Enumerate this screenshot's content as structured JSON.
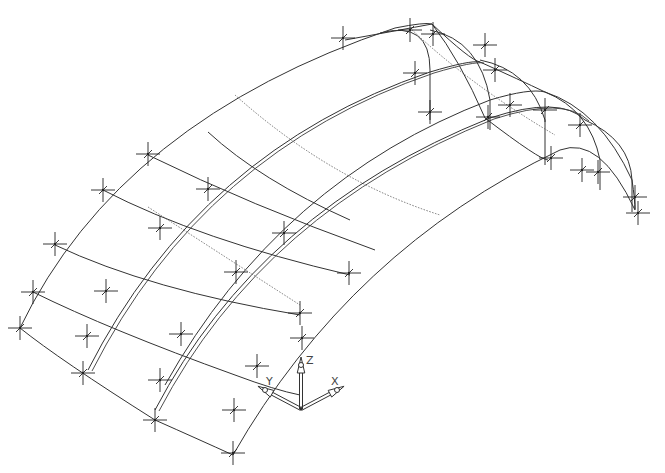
{
  "drawing": {
    "type": "isometric wireframe",
    "subject": "curved vault roof shell",
    "line_color": "#333333",
    "background": "#ffffff"
  },
  "ucs_icon": {
    "origin": [
      301,
      409
    ],
    "axes": [
      {
        "label": "Z",
        "tip": [
          301,
          365
        ],
        "label_pos": [
          306,
          364
        ]
      },
      {
        "label": "Y",
        "tip": [
          265,
          390
        ],
        "label_pos": [
          266,
          385
        ]
      },
      {
        "label": "X",
        "tip": [
          337,
          390
        ],
        "label_pos": [
          331,
          385
        ]
      }
    ]
  },
  "longitudinal_arcs": [
    {
      "d": "M 20 328 Q 120 120 395 28 Q 425 22 432 24",
      "double": false
    },
    {
      "d": "M 88 370 Q 200 150 430 72 Q 470 60 480 62",
      "double": true
    },
    {
      "d": "M 165 385 Q 280 180 490 100 Q 530 88 545 92",
      "double": false
    },
    {
      "d": "M 155 410 Q 260 210 490 118 Q 560 95 585 120",
      "double": true
    },
    {
      "d": "M 233 455 Q 350 250 560 150 Q 600 135 635 210",
      "double": false
    }
  ],
  "transverse_arcs": [
    {
      "d": "M 20 328 Q 60 360 155 420 Q 200 440 233 455"
    },
    {
      "d": "M 33 292 Q 110 330 235 375 Q 275 390 300 395"
    },
    {
      "d": "M 55 245 Q 150 290 300 315"
    },
    {
      "d": "M 103 190 Q 200 240 350 275"
    },
    {
      "d": "M 148 155 Q 250 205 375 250"
    },
    {
      "d": "M 208 132 Q 260 180 350 220"
    },
    {
      "d": "M 345 40 Q 400 30 432 24 Q 470 60 480 62"
    },
    {
      "d": "M 432 24 Q 460 60 485 118 Q 540 160 548 160"
    },
    {
      "d": "M 480 62 Q 520 80 545 92 Q 600 110 632 180 Q 635 200 635 210"
    }
  ],
  "end_arches": [
    {
      "d": "M 380 33 Q 430 20 430 70 L 430 120"
    },
    {
      "d": "M 430 30 Q 480 40 490 100 L 490 130"
    },
    {
      "d": "M 480 60 Q 530 70 545 120 L 545 165"
    },
    {
      "d": "M 545 92 Q 590 110 600 160 L 600 190"
    },
    {
      "d": "M 585 120 Q 630 140 632 180 L 632 212"
    }
  ],
  "dotted_lines": [
    {
      "d": "M 235 95 Q 330 180 440 215"
    },
    {
      "d": "M 410 28 Q 470 85 555 135"
    },
    {
      "d": "M 148 207 Q 230 260 300 305"
    }
  ],
  "nodes": [
    [
      343,
      38
    ],
    [
      410,
      30
    ],
    [
      433,
      34
    ],
    [
      485,
      45
    ],
    [
      415,
      73
    ],
    [
      488,
      117
    ],
    [
      510,
      105
    ],
    [
      545,
      110
    ],
    [
      551,
      158
    ],
    [
      580,
      125
    ],
    [
      598,
      172
    ],
    [
      582,
      170
    ],
    [
      635,
      197
    ],
    [
      638,
      213
    ],
    [
      430,
      112
    ],
    [
      495,
      70
    ],
    [
      148,
      154
    ],
    [
      208,
      189
    ],
    [
      103,
      190
    ],
    [
      160,
      228
    ],
    [
      284,
      233
    ],
    [
      55,
      244
    ],
    [
      106,
      291
    ],
    [
      236,
      272
    ],
    [
      349,
      273
    ],
    [
      33,
      292
    ],
    [
      300,
      313
    ],
    [
      20,
      328
    ],
    [
      87,
      336
    ],
    [
      181,
      334
    ],
    [
      257,
      366
    ],
    [
      302,
      338
    ],
    [
      83,
      373
    ],
    [
      160,
      380
    ],
    [
      234,
      410
    ],
    [
      155,
      420
    ],
    [
      233,
      453
    ]
  ],
  "node_size": 12
}
